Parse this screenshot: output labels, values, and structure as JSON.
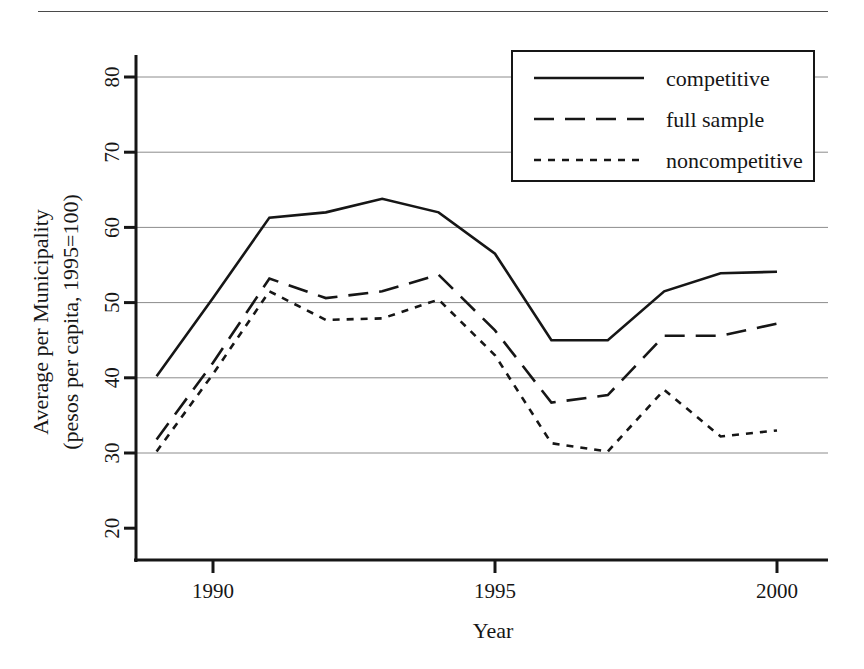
{
  "figure": {
    "top_rule": true,
    "background_color": "#ffffff",
    "ink_color": "#161616",
    "grid_color": "#8c8c8c"
  },
  "chart_data": {
    "type": "line",
    "title": "",
    "xlabel": "Year",
    "ylabel": "Average per Municipality\n(pesos per capita, 1995=100)",
    "ylabel_line1": "Average per Municipality",
    "ylabel_line2": "(pesos per capita, 1995=100)",
    "x": [
      1989,
      1990,
      1991,
      1992,
      1993,
      1994,
      1995,
      1996,
      1997,
      1998,
      1999,
      2000
    ],
    "xlim": [
      1988.8,
      2000.4
    ],
    "ylim": [
      20,
      83
    ],
    "xticks": [
      1990,
      1995,
      2000
    ],
    "xticklabels": [
      "1990",
      "1995",
      "2000"
    ],
    "yticks": [
      20,
      30,
      40,
      50,
      60,
      70,
      80
    ],
    "yticklabels": [
      "20",
      "30",
      "40",
      "50",
      "60",
      "70",
      "80"
    ],
    "grid": "horizontal",
    "legend_position": "upper right",
    "series": [
      {
        "name": "competitive",
        "style": "solid",
        "values": [
          40.2,
          50.6,
          61.3,
          62.0,
          63.8,
          62.0,
          56.5,
          45.0,
          45.0,
          51.5,
          53.9,
          54.1
        ]
      },
      {
        "name": "full sample",
        "style": "dashed",
        "values": [
          31.8,
          42.0,
          53.2,
          50.6,
          51.5,
          53.7,
          46.3,
          36.7,
          37.7,
          45.6,
          45.6,
          47.2
        ]
      },
      {
        "name": "noncompetitive",
        "style": "dotted",
        "values": [
          30.2,
          40.5,
          51.5,
          47.7,
          47.9,
          50.4,
          43.0,
          31.3,
          30.2,
          38.4,
          32.2,
          33.0
        ]
      }
    ]
  },
  "legend": {
    "entries": [
      {
        "label": "competitive",
        "style": "solid"
      },
      {
        "label": "full sample",
        "style": "dashed"
      },
      {
        "label": "noncompetitive",
        "style": "dotted"
      }
    ]
  }
}
